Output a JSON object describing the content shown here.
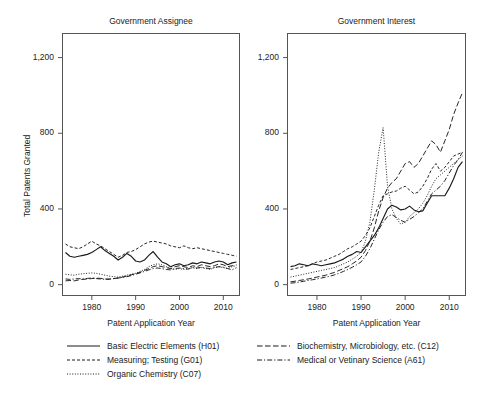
{
  "figure": {
    "caption": "Fig. 14   Number of patents granted by年 assignee and by CPC class",
    "ylabel": "Total Patents Granted",
    "xlabel": "Patent Application Year"
  },
  "axes": {
    "y_ticks": [
      "0",
      "400",
      "800",
      "1,200"
    ],
    "y_tick_values": [
      0,
      400,
      800,
      1200
    ],
    "ylim": [
      -60,
      1330
    ],
    "x_ticks": [
      "1980",
      "1990",
      "2000",
      "2010"
    ],
    "x_tick_values": [
      1980,
      1990,
      2000,
      2010
    ],
    "xlim": [
      1973.2,
      2013.8
    ]
  },
  "panels": [
    {
      "title": "Government Assignee"
    },
    {
      "title": "Government Interest"
    }
  ],
  "legend": {
    "left_column": [
      {
        "label": "Basic Electric Elements (H01)",
        "style": "solid",
        "key": "H01"
      },
      {
        "label": "Measuring; Testing (G01)",
        "style": "dashed",
        "key": "G01"
      },
      {
        "label": "Organic Chemistry (C07)",
        "style": "dotted",
        "key": "C07"
      }
    ],
    "right_column": [
      {
        "label": "Biochemistry, Microbiology, etc. (C12)",
        "style": "longdash",
        "key": "C12"
      },
      {
        "label": "Medical or Vetinary Science (A61)",
        "style": "dashdot",
        "key": "A61"
      }
    ]
  },
  "colors": {
    "line": "#1a1a1a",
    "frame": "#555555",
    "background": "#ffffff"
  },
  "chart_data": {
    "type": "line",
    "title": "",
    "xlabel": "Patent Application Year",
    "ylabel": "Total Patents Granted",
    "xlim": [
      1973.2,
      2013.8
    ],
    "ylim": [
      -60,
      1330
    ],
    "grid": false,
    "legend_position": "bottom",
    "x": [
      1974,
      1975,
      1976,
      1977,
      1978,
      1979,
      1980,
      1981,
      1982,
      1983,
      1984,
      1985,
      1986,
      1987,
      1988,
      1989,
      1990,
      1991,
      1992,
      1993,
      1994,
      1995,
      1996,
      1997,
      1998,
      1999,
      2000,
      2001,
      2002,
      2003,
      2004,
      2005,
      2006,
      2007,
      2008,
      2009,
      2010,
      2011,
      2012,
      2013
    ],
    "panels": [
      {
        "name": "Government Assignee",
        "series": [
          {
            "name": "Basic Electric Elements (H01)",
            "style": "solid",
            "values": [
              170,
              150,
              145,
              150,
              155,
              160,
              170,
              185,
              200,
              180,
              165,
              150,
              130,
              145,
              165,
              150,
              125,
              120,
              130,
              155,
              175,
              145,
              120,
              110,
              95,
              105,
              110,
              100,
              105,
              115,
              110,
              120,
              115,
              110,
              120,
              125,
              120,
              105,
              115,
              120
            ]
          },
          {
            "name": "Measuring; Testing (G01)",
            "style": "dashed",
            "values": [
              215,
              200,
              195,
              190,
              200,
              215,
              230,
              215,
              205,
              190,
              175,
              160,
              145,
              155,
              170,
              175,
              185,
              200,
              215,
              225,
              230,
              225,
              220,
              215,
              205,
              200,
              195,
              205,
              195,
              190,
              195,
              190,
              185,
              180,
              175,
              170,
              165,
              160,
              155,
              150
            ]
          },
          {
            "name": "Organic Chemistry (C07)",
            "style": "dotted",
            "values": [
              55,
              52,
              50,
              55,
              58,
              60,
              62,
              60,
              55,
              50,
              45,
              42,
              40,
              45,
              50,
              55,
              60,
              70,
              80,
              95,
              105,
              110,
              105,
              95,
              85,
              80,
              85,
              80,
              85,
              90,
              85,
              90,
              85,
              80,
              90,
              95,
              90,
              85,
              95,
              100
            ]
          },
          {
            "name": "Biochemistry, Microbiology, etc. (C12)",
            "style": "longdash",
            "values": [
              20,
              22,
              20,
              25,
              28,
              30,
              32,
              35,
              33,
              30,
              28,
              32,
              35,
              40,
              45,
              52,
              58,
              65,
              75,
              85,
              95,
              100,
              95,
              90,
              85,
              95,
              100,
              95,
              90,
              100,
              95,
              105,
              100,
              95,
              100,
              110,
              105,
              95,
              100,
              105
            ]
          },
          {
            "name": "Medical or Vetinary Science (A61)",
            "style": "dashdot",
            "values": [
              30,
              28,
              30,
              32,
              30,
              33,
              35,
              32,
              30,
              28,
              30,
              32,
              35,
              38,
              42,
              48,
              55,
              62,
              70,
              78,
              85,
              88,
              85,
              80,
              78,
              85,
              88,
              85,
              82,
              90,
              88,
              92,
              88,
              85,
              90,
              95,
              92,
              85,
              78,
              90
            ]
          }
        ]
      },
      {
        "name": "Government Interest",
        "series": [
          {
            "name": "Basic Electric Elements (H01)",
            "style": "solid",
            "values": [
              95,
              100,
              110,
              105,
              100,
              110,
              105,
              100,
              105,
              110,
              115,
              125,
              135,
              150,
              160,
              175,
              170,
              200,
              230,
              260,
              300,
              350,
              400,
              420,
              410,
              395,
              400,
              415,
              395,
              385,
              390,
              430,
              470,
              470,
              470,
              470,
              510,
              560,
              620,
              650
            ]
          },
          {
            "name": "Measuring; Testing (G01)",
            "style": "dashed",
            "values": [
              80,
              85,
              90,
              95,
              100,
              110,
              120,
              125,
              130,
              140,
              150,
              160,
              175,
              190,
              200,
              215,
              230,
              260,
              300,
              360,
              420,
              470,
              480,
              490,
              495,
              510,
              520,
              500,
              480,
              490,
              520,
              560,
              610,
              640,
              600,
              620,
              650,
              680,
              690,
              700
            ]
          },
          {
            "name": "Organic Chemistry (C07)",
            "style": "dotted",
            "values": [
              40,
              45,
              50,
              55,
              60,
              65,
              70,
              75,
              80,
              85,
              90,
              100,
              110,
              120,
              135,
              150,
              170,
              230,
              330,
              500,
              700,
              830,
              520,
              400,
              350,
              320,
              330,
              360,
              380,
              400,
              430,
              470,
              520,
              560,
              580,
              600,
              620,
              640,
              660,
              680
            ]
          },
          {
            "name": "Biochemistry, Microbiology, etc. (C12)",
            "style": "longdash",
            "values": [
              15,
              18,
              22,
              26,
              30,
              35,
              40,
              45,
              50,
              58,
              65,
              75,
              85,
              95,
              110,
              125,
              145,
              180,
              230,
              300,
              390,
              460,
              510,
              540,
              560,
              600,
              640,
              650,
              620,
              640,
              680,
              720,
              760,
              740,
              700,
              760,
              820,
              900,
              960,
              1015
            ]
          },
          {
            "name": "Medical or Vetinary Science (A61)",
            "style": "dashdot",
            "values": [
              8,
              10,
              14,
              18,
              22,
              26,
              30,
              35,
              40,
              45,
              52,
              60,
              70,
              80,
              92,
              105,
              120,
              150,
              190,
              240,
              290,
              330,
              360,
              370,
              355,
              340,
              330,
              345,
              360,
              380,
              400,
              440,
              480,
              500,
              520,
              550,
              590,
              630,
              660,
              700
            ]
          }
        ]
      }
    ]
  }
}
